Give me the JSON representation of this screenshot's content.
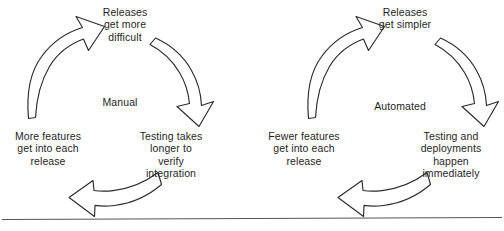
{
  "figure": {
    "background_color": "#ffffff",
    "stroke_color": "#2b2b2b",
    "baseline_color": "#555555"
  },
  "cycles": [
    {
      "id": "manual",
      "center_label": "Manual",
      "nodes": [
        {
          "position": "top",
          "text": "Releases\nget more\ndifficult"
        },
        {
          "position": "right",
          "text": "Testing takes\nlonger to\nverify\nintegration"
        },
        {
          "position": "left",
          "text": "More features\nget into each\nrelease"
        }
      ],
      "arrows": [
        {
          "id": "manual-arrow-top-right",
          "direction": "down-right",
          "from": "top",
          "to": "right"
        },
        {
          "id": "manual-arrow-bottom",
          "direction": "left",
          "from": "right",
          "to": "left"
        },
        {
          "id": "manual-arrow-top-left",
          "direction": "up-right",
          "from": "left",
          "to": "top"
        }
      ]
    },
    {
      "id": "automated",
      "center_label": "Automated",
      "nodes": [
        {
          "position": "top",
          "text": "Releases\nget simpler"
        },
        {
          "position": "right",
          "text": "Testing and\ndeployments\nhappen\nimmediately"
        },
        {
          "position": "left",
          "text": "Fewer features\nget into each\nrelease"
        }
      ],
      "arrows": [
        {
          "id": "automated-arrow-top-right",
          "direction": "down-right",
          "from": "top",
          "to": "right"
        },
        {
          "id": "automated-arrow-bottom",
          "direction": "left",
          "from": "right",
          "to": "left"
        },
        {
          "id": "automated-arrow-top-left",
          "direction": "up-right",
          "from": "left",
          "to": "top"
        }
      ]
    }
  ],
  "baseline": {
    "present": true
  }
}
